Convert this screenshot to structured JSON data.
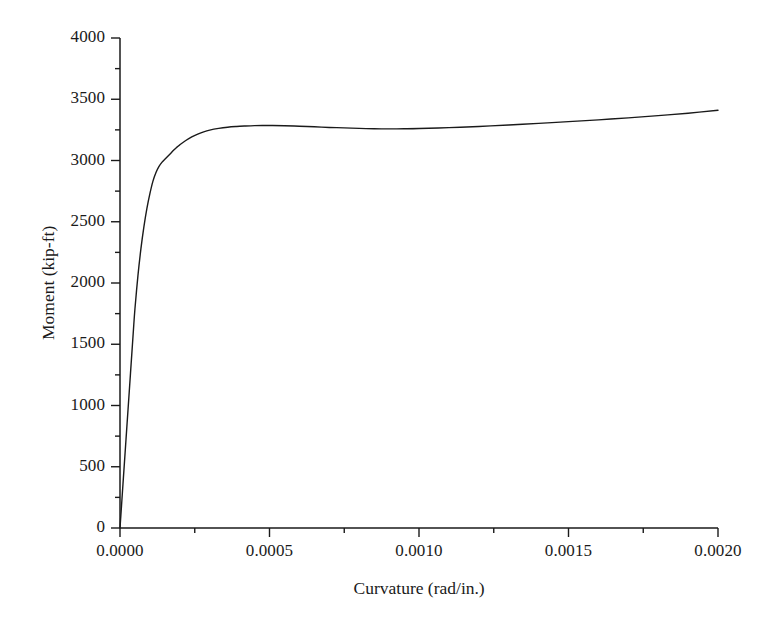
{
  "chart_data": {
    "type": "line",
    "title": "",
    "xlabel": "Curvature (rad/in.)",
    "ylabel": "Moment (kip-ft)",
    "xlim": [
      0.0,
      0.002
    ],
    "ylim": [
      0,
      4000
    ],
    "xticks": [
      0.0,
      0.0005,
      0.001,
      0.0015,
      0.002
    ],
    "xtick_labels": [
      "0.0000",
      "0.0005",
      "0.0010",
      "0.0015",
      "0.0020"
    ],
    "x_minor_tick_count_per_interval": 1,
    "yticks": [
      0,
      500,
      1000,
      1500,
      2000,
      2500,
      3000,
      3500,
      4000
    ],
    "ytick_labels": [
      "0",
      "500",
      "1000",
      "1500",
      "2000",
      "2500",
      "3000",
      "3500",
      "4000"
    ],
    "y_minor_tick_count_per_interval": 1,
    "grid": false,
    "legend": null,
    "series": [
      {
        "name": "moment-curvature",
        "color": "#1a1a1a",
        "line_width": 1.4,
        "x": [
          0.0,
          5e-06,
          1e-05,
          1.5e-05,
          2e-05,
          2.5e-05,
          3e-05,
          3.5e-05,
          4e-05,
          4.5e-05,
          5e-05,
          6e-05,
          7e-05,
          8e-05,
          9e-05,
          0.0001,
          0.00011,
          0.00012,
          0.00013,
          0.00014,
          0.00015,
          0.00016,
          0.00017,
          0.00018,
          0.00019,
          0.0002,
          0.00022,
          0.00024,
          0.00026,
          0.00028,
          0.0003,
          0.00033,
          0.00036,
          0.00039,
          0.00042,
          0.00045,
          0.00048,
          0.00051,
          0.00055,
          0.0006,
          0.00065,
          0.0007,
          0.00075,
          0.0008,
          0.00085,
          0.0009,
          0.00095,
          0.001,
          0.0011,
          0.0012,
          0.0013,
          0.0014,
          0.0015,
          0.0016,
          0.0017,
          0.0018,
          0.0019,
          0.002
        ],
        "y": [
          0,
          180,
          360,
          540,
          720,
          900,
          1080,
          1260,
          1440,
          1620,
          1790,
          2060,
          2280,
          2460,
          2610,
          2730,
          2830,
          2900,
          2950,
          2985,
          3010,
          3035,
          3060,
          3085,
          3108,
          3128,
          3163,
          3192,
          3215,
          3234,
          3248,
          3262,
          3272,
          3278,
          3282,
          3285,
          3286,
          3286,
          3284,
          3280,
          3275,
          3270,
          3266,
          3262,
          3259,
          3258,
          3259,
          3261,
          3268,
          3278,
          3290,
          3303,
          3317,
          3332,
          3348,
          3366,
          3386,
          3410
        ]
      }
    ],
    "annotations": {
      "peak_moment": 3286,
      "peak_curvature": 0.0005,
      "local_min_moment": 3258,
      "local_min_curvature": 0.0009,
      "end_moment": 3410,
      "end_curvature": 0.002
    }
  },
  "axes": {
    "spine_color": "#1a1a1a",
    "tick_direction": "out",
    "background": "#ffffff"
  }
}
